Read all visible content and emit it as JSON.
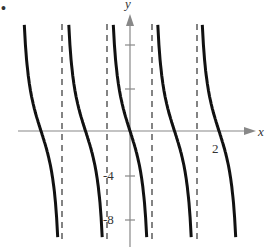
{
  "marker": "•",
  "chart_data": {
    "type": "line",
    "title": "",
    "function": "y = -4 tan(πx)",
    "xlabel": "x",
    "ylabel": "y",
    "x_tick_labels": [
      "2"
    ],
    "y_tick_labels": [
      "-4",
      "-8"
    ],
    "xlim": [
      -2.5,
      2.7
    ],
    "ylim": [
      -10,
      10
    ],
    "asymptotes_x": [
      -1.5,
      -0.5,
      0.5,
      1.5
    ],
    "zeros_x": [
      -2,
      -1,
      0,
      1,
      2
    ],
    "series": [
      {
        "name": "branch 1",
        "x_range": [
          -2.4,
          -1.6
        ]
      },
      {
        "name": "branch 2",
        "x_range": [
          -1.4,
          -0.6
        ]
      },
      {
        "name": "branch 3",
        "x_range": [
          -0.4,
          0.4
        ]
      },
      {
        "name": "branch 4",
        "x_range": [
          0.6,
          1.4
        ]
      },
      {
        "name": "branch 5",
        "x_range": [
          1.6,
          2.4
        ]
      }
    ],
    "grid": false,
    "legend": "none"
  }
}
